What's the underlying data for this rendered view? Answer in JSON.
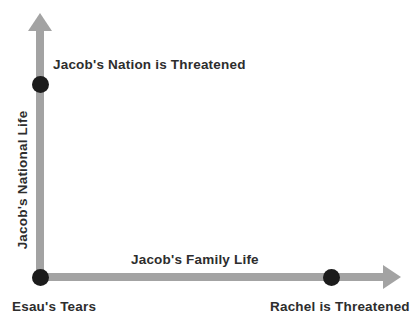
{
  "diagram": {
    "y_axis": {
      "label": "Jacob's National Life"
    },
    "x_axis": {
      "label": "Jacob's Family Life"
    },
    "points": [
      {
        "label": "Jacob's Nation is Threatened",
        "on": "y-axis"
      },
      {
        "label": "Esau's Tears",
        "on": "origin"
      },
      {
        "label": "Rachel is Threatened",
        "on": "x-axis"
      }
    ],
    "colors": {
      "arrow": "#a3a3a3",
      "dot": "#1c1c1c",
      "text": "#2d2d2d",
      "background": "#ffffff"
    }
  }
}
